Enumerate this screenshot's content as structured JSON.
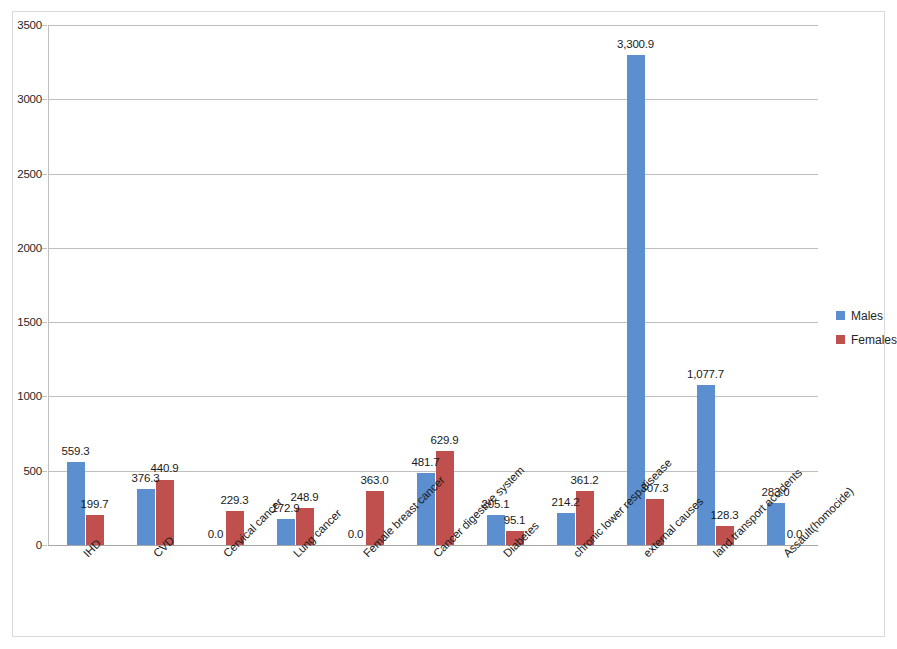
{
  "chart_data": {
    "type": "bar",
    "title": "",
    "subtitle": "",
    "xlabel": "",
    "ylabel": "",
    "ylim": [
      0,
      3500
    ],
    "y_ticks": [
      "0",
      "500",
      "1000",
      "1500",
      "2000",
      "2500",
      "3000",
      "3500"
    ],
    "y_tick_values": [
      0,
      500,
      1000,
      1500,
      2000,
      2500,
      3000,
      3500
    ],
    "grid": true,
    "legend_position": "right",
    "categories": [
      "IHD",
      "CVD",
      "Cervical cancer",
      "Lung cancer",
      "Female breast cancer",
      "Cancer digestive system",
      "Diabetes",
      "chronic lower resp disease",
      "external causes",
      "land transport accidents",
      "Assault(homocide)"
    ],
    "series": [
      {
        "name": "Males",
        "color": "#5b8fd0",
        "values": [
          559.3,
          376.3,
          0.0,
          172.9,
          0.0,
          481.7,
          205.1,
          214.2,
          3300.9,
          1077.7,
          283.0
        ],
        "labels": [
          "559.3",
          "376.3",
          "0.0",
          "172.9",
          "0.0",
          "481.7",
          "205.1",
          "214.2",
          "3,300.9",
          "1,077.7",
          "283.0"
        ]
      },
      {
        "name": "Females",
        "color": "#c0504d",
        "values": [
          199.7,
          440.9,
          229.3,
          248.9,
          363.0,
          629.9,
          95.1,
          361.2,
          307.3,
          128.3,
          0.0
        ],
        "labels": [
          "199.7",
          "440.9",
          "229.3",
          "248.9",
          "363.0",
          "629.9",
          "95.1",
          "361.2",
          "307.3",
          "128.3",
          "0.0"
        ]
      }
    ]
  },
  "legend": {
    "items": [
      {
        "label": "Males",
        "color": "#5b8fd0"
      },
      {
        "label": "Females",
        "color": "#c0504d"
      }
    ]
  }
}
